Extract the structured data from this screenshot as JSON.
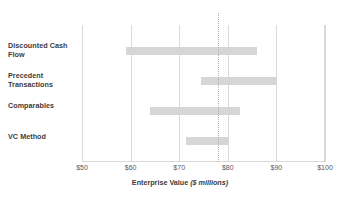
{
  "chart_data": {
    "type": "bar",
    "subtype": "floating-range-bar",
    "title": "",
    "xlabel": "Enterprise Value ($ millions)",
    "xlabel_main": "Enterprise Value",
    "xlabel_units": "($ millions)",
    "ylabel": "",
    "xlim": [
      50,
      100
    ],
    "xticks": [
      50,
      60,
      70,
      80,
      90,
      100
    ],
    "xtick_labels": [
      "$50",
      "$60",
      "$70",
      "$80",
      "$90",
      "$100"
    ],
    "grid": true,
    "grid_axis": "x",
    "legend": false,
    "categories": [
      "Discounted Cash Flow",
      "Precedent Transactions",
      "Comparables",
      "VC Method"
    ],
    "series": [
      {
        "name": "Valuation range",
        "color": "#d6d6d6",
        "ranges": [
          {
            "category": "Discounted Cash Flow",
            "low": 59.0,
            "high": 86.0
          },
          {
            "category": "Precedent Transactions",
            "low": 74.5,
            "high": 90.0
          },
          {
            "category": "Comparables",
            "low": 64.0,
            "high": 82.5
          },
          {
            "category": "VC Method",
            "low": 71.5,
            "high": 80.0
          }
        ]
      }
    ],
    "reference_line": {
      "value": 78,
      "label": "$78",
      "style": "dotted",
      "color": "#b0b0b0"
    },
    "colors": {
      "bar": "#d6d6d6",
      "grid": "#d9d9d9",
      "text": "#3b3b3b",
      "tick_text": "#595959",
      "reference": "#b0b0b0"
    }
  },
  "labels": {
    "cat_0_line_1": "Discounted Cash",
    "cat_0_line_2": "Flow",
    "cat_1_line_1": "Precedent",
    "cat_1_line_2": "Transactions",
    "cat_2_line_1": "Comparables",
    "cat_3_line_1": "VC Method"
  }
}
